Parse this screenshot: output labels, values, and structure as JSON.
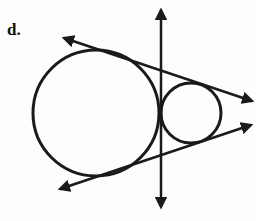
{
  "figure": {
    "label": "d.",
    "stroke_color": "#1a1a1a",
    "large_circle": {
      "cx": 96,
      "cy": 113,
      "r": 63
    },
    "small_circle": {
      "cx": 191,
      "cy": 113,
      "r": 30
    },
    "internal_tangent": {
      "x1": 161,
      "y1": 10,
      "x2": 161,
      "y2": 207
    },
    "upper_external_tangent": {
      "x1": 64,
      "y1": 38,
      "x2": 252,
      "y2": 101
    },
    "lower_external_tangent": {
      "x1": 60,
      "y1": 189,
      "x2": 251,
      "y2": 125
    }
  }
}
